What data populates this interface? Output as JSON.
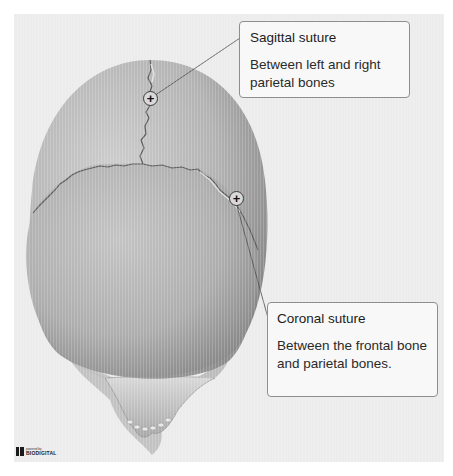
{
  "figure": {
    "colors": {
      "background": "#ececec",
      "outer_margin": "#ffffff",
      "bone_light": "#c9c9c9",
      "bone_dark": "#8a8a8a",
      "callout_border": "#8e8e8e",
      "callout_bg": "#f8f8f8",
      "text": "#1c1c1c"
    }
  },
  "callouts": [
    {
      "title": "Sagittal suture",
      "description": "Between left and right parietal bones",
      "marker_symbol": "+"
    },
    {
      "title": "Coronal suture",
      "description": "Between the frontal bone and parietal bones.",
      "marker_symbol": "+"
    }
  ],
  "branding": {
    "small_text": "powered by",
    "name": "BIODIGITAL"
  }
}
